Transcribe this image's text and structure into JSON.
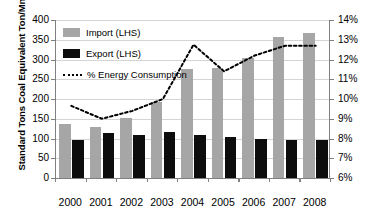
{
  "chart_data": {
    "type": "bar",
    "title": "",
    "xlabel": "",
    "ylabel": "Standard Tons Coal Equivalent Ton/Mn",
    "ylabel_right": "",
    "categories": [
      "2000",
      "2001",
      "2002",
      "2003",
      "2004",
      "2005",
      "2006",
      "2007",
      "2008"
    ],
    "ylim": [
      0,
      400
    ],
    "yticks": [
      0,
      50,
      100,
      150,
      200,
      250,
      300,
      350,
      400
    ],
    "ytick_labels": [
      "0",
      "50",
      "100",
      "150",
      "200",
      "250",
      "300",
      "350",
      "400"
    ],
    "ylim_right": [
      6,
      14
    ],
    "yticks_right": [
      6,
      7,
      8,
      9,
      10,
      11,
      12,
      13,
      14
    ],
    "ytick_labels_right": [
      "6%",
      "7%",
      "8%",
      "9%",
      "10%",
      "11%",
      "12%",
      "13%",
      "14%"
    ],
    "grid": true,
    "legend_position": "upper-left",
    "series": [
      {
        "name": "Import (LHS)",
        "type": "bar",
        "axis": "left",
        "color": "#a6a6a6",
        "values": [
          138,
          130,
          151,
          192,
          275,
          278,
          303,
          358,
          368
        ]
      },
      {
        "name": "Export (LHS)",
        "type": "bar",
        "axis": "left",
        "color": "#0d0d0d",
        "values": [
          96,
          114,
          110,
          116,
          110,
          105,
          100,
          96,
          96
        ]
      },
      {
        "name": "% Energy Consumption",
        "type": "line",
        "axis": "right",
        "color": "#000000",
        "style": "dotted",
        "values": [
          9.65,
          9.0,
          9.4,
          10.0,
          12.75,
          11.4,
          12.2,
          12.7,
          12.7
        ]
      }
    ]
  },
  "legend": {
    "items": [
      {
        "label": "Import (LHS)",
        "swatch": "import"
      },
      {
        "label": "Export (LHS)",
        "swatch": "export"
      },
      {
        "label": "% Energy Consumption",
        "swatch": "line"
      }
    ]
  },
  "axes": {
    "left_title": "Standard Tons Coal Equivalent Ton/Mn"
  },
  "colors": {
    "import_bar": "#a6a6a6",
    "export_bar": "#0d0d0d",
    "line": "#000000",
    "grid": "#d4d4d4",
    "axis": "#808080",
    "background": "#ffffff"
  }
}
